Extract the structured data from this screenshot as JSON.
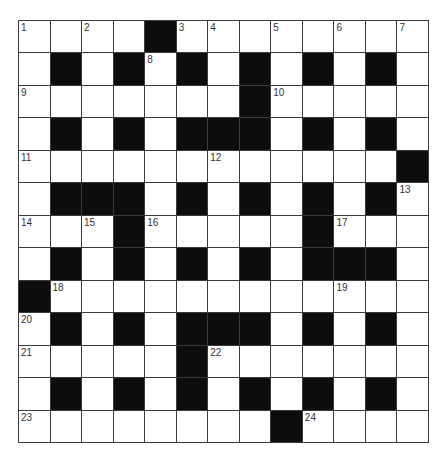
{
  "puzzle": {
    "rows": 13,
    "cols": 13,
    "colors": {
      "block": "#0d0d0d",
      "empty": "#ffffff",
      "line": "#3a3a3a"
    },
    "layout": [
      "....#........",
      ".#.#.#.#.#.#.",
      ".......#.....",
      ".#.#.###.#.#.",
      "............#",
      ".###.#.#.#.#.",
      "...#.....#...",
      ".#.#.#.#.###.",
      "#............",
      ".#.#.###.#.#.",
      ".....#.......",
      ".#.#.#.#.#.#.",
      "........#...."
    ],
    "numbers": [
      {
        "r": 0,
        "c": 0,
        "n": "1"
      },
      {
        "r": 0,
        "c": 2,
        "n": "2"
      },
      {
        "r": 0,
        "c": 5,
        "n": "3"
      },
      {
        "r": 0,
        "c": 6,
        "n": "4"
      },
      {
        "r": 0,
        "c": 8,
        "n": "5"
      },
      {
        "r": 0,
        "c": 10,
        "n": "6"
      },
      {
        "r": 0,
        "c": 12,
        "n": "7"
      },
      {
        "r": 1,
        "c": 4,
        "n": "8"
      },
      {
        "r": 2,
        "c": 0,
        "n": "9"
      },
      {
        "r": 2,
        "c": 8,
        "n": "10"
      },
      {
        "r": 4,
        "c": 0,
        "n": "11"
      },
      {
        "r": 4,
        "c": 6,
        "n": "12"
      },
      {
        "r": 5,
        "c": 12,
        "n": "13"
      },
      {
        "r": 6,
        "c": 0,
        "n": "14"
      },
      {
        "r": 6,
        "c": 2,
        "n": "15"
      },
      {
        "r": 6,
        "c": 4,
        "n": "16"
      },
      {
        "r": 6,
        "c": 10,
        "n": "17"
      },
      {
        "r": 8,
        "c": 1,
        "n": "18"
      },
      {
        "r": 8,
        "c": 10,
        "n": "19"
      },
      {
        "r": 9,
        "c": 0,
        "n": "20"
      },
      {
        "r": 10,
        "c": 0,
        "n": "21"
      },
      {
        "r": 10,
        "c": 6,
        "n": "22"
      },
      {
        "r": 12,
        "c": 0,
        "n": "23"
      },
      {
        "r": 12,
        "c": 9,
        "n": "24"
      }
    ]
  }
}
